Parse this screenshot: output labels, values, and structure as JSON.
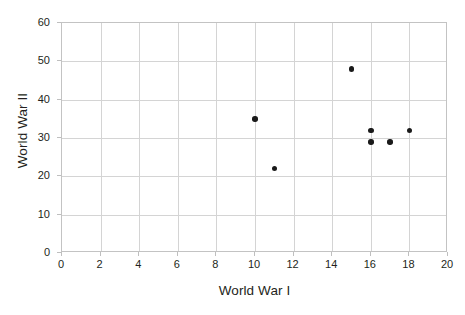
{
  "chart_data": {
    "type": "scatter",
    "title": "",
    "xlabel": "World War I",
    "ylabel": "World War II",
    "xlim": [
      0,
      20
    ],
    "ylim": [
      0,
      60
    ],
    "xticks": [
      0,
      2,
      4,
      6,
      8,
      10,
      12,
      14,
      16,
      18,
      20
    ],
    "yticks": [
      0,
      10,
      20,
      30,
      40,
      50,
      60
    ],
    "xtick_labels": [
      "0",
      "2",
      "4",
      "6",
      "8",
      "10",
      "12",
      "14",
      "16",
      "18",
      "20"
    ],
    "ytick_labels": [
      "0",
      "10",
      "20",
      "30",
      "40",
      "50",
      "60"
    ],
    "grid": true,
    "grid_color": "#d4d4d4",
    "legend": false,
    "marker_color": "#1a1a1a",
    "plot_border_color": "#c3c3c3",
    "background_color": "#ffffff",
    "points": [
      {
        "x": 10,
        "y": 35
      },
      {
        "x": 11,
        "y": 22
      },
      {
        "x": 15,
        "y": 48
      },
      {
        "x": 16,
        "y": 32
      },
      {
        "x": 16,
        "y": 29
      },
      {
        "x": 17,
        "y": 29
      },
      {
        "x": 18,
        "y": 32
      }
    ]
  }
}
